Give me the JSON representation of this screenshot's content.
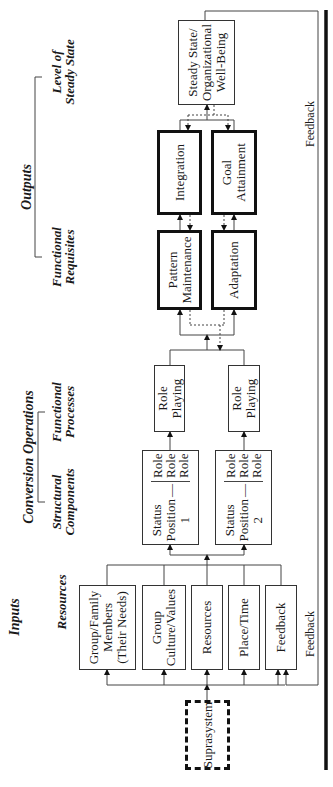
{
  "diagram": {
    "headers": {
      "inputs": "Inputs",
      "resources": "Resources",
      "conversion_operations": "Conversion Operations",
      "structural_components": [
        "Structural",
        "Components"
      ],
      "functional_processes": [
        "Functional",
        "Processes"
      ],
      "outputs": "Outputs",
      "functional_requisites": [
        "Functional",
        "Requisites"
      ],
      "level_of_steady_state": [
        "Level of",
        "Steady State"
      ]
    },
    "suprasystem": "Suprasystem",
    "inputs": [
      {
        "lines": [
          "Group/Family",
          "Members",
          "(Their Needs)"
        ]
      },
      {
        "lines": [
          "Group",
          "Culture/Values"
        ]
      },
      {
        "lines": [
          "Resources"
        ]
      },
      {
        "lines": [
          "Place/Time"
        ]
      },
      {
        "lines": [
          "Feedback"
        ]
      }
    ],
    "status_positions": [
      {
        "lines": [
          "Status",
          "Position",
          "1"
        ],
        "roles": [
          "Role",
          "Role",
          "Role"
        ]
      },
      {
        "lines": [
          "Status",
          "Position",
          "2"
        ],
        "roles": [
          "Role",
          "Role",
          "Role"
        ]
      }
    ],
    "role_playing": [
      "Role Playing",
      "Role Playing"
    ],
    "functional_requisites": [
      {
        "lines": [
          "Pattern",
          "Maintenance"
        ]
      },
      {
        "lines": [
          "Adaptation"
        ]
      },
      {
        "lines": [
          "Integration"
        ]
      },
      {
        "lines": [
          "Goal",
          "Attainment"
        ]
      }
    ],
    "steady_state": [
      "Steady State/",
      "Organizational",
      "Well-Being"
    ],
    "feedback_labels": [
      "Feedback",
      "Feedback"
    ]
  }
}
